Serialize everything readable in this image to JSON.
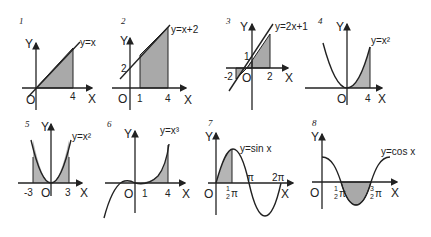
{
  "colors": {
    "shade": "#a9a9a9",
    "line": "#222222",
    "background": "#ffffff"
  },
  "panels": [
    {
      "number": "1",
      "equation": "y=x",
      "x_label": "X",
      "y_label": "Y",
      "origin": "O",
      "ticks": [
        "4"
      ],
      "shaded_interval": "0 to 4"
    },
    {
      "number": "2",
      "equation": "y=x+2",
      "x_label": "X",
      "y_label": "Y",
      "origin": "O",
      "ticks": [
        "1",
        "4"
      ],
      "y_ticks": [
        "2"
      ],
      "shaded_interval": "1 to 4"
    },
    {
      "number": "3",
      "equation": "y=2x+1",
      "x_label": "X",
      "y_label": "Y",
      "origin": "O",
      "ticks": [
        "-2",
        "2"
      ],
      "y_ticks": [
        "1"
      ],
      "shaded_interval": "-2 to 2"
    },
    {
      "number": "4",
      "equation": "y=x²",
      "x_label": "X",
      "y_label": "Y",
      "origin": "O",
      "ticks": [
        "4"
      ],
      "shaded_interval": "0 to 4"
    },
    {
      "number": "5",
      "equation": "y=x²",
      "x_label": "X",
      "y_label": "Y",
      "origin": "O",
      "ticks": [
        "-3",
        "3"
      ],
      "shaded_interval": "-3 to 3"
    },
    {
      "number": "6",
      "equation": "y=x³",
      "x_label": "X",
      "y_label": "Y",
      "origin": "O",
      "ticks": [
        "1",
        "4"
      ],
      "shaded_interval": "1 to 4"
    },
    {
      "number": "7",
      "equation": "y=sin x",
      "x_label": "X",
      "y_label": "Y",
      "origin": "O",
      "ticks": [
        "½π",
        "π",
        "2π"
      ],
      "tick_half_num": "1",
      "tick_half_den": "2",
      "tick_pi": "π",
      "shaded_interval": "0 to π/2"
    },
    {
      "number": "8",
      "equation": "y=cos x",
      "x_label": "X",
      "y_label": "Y",
      "origin": "O",
      "ticks": [
        "½π",
        "³⁄₂π"
      ],
      "tick_half_num": "1",
      "tick_half_den": "2",
      "tick_three_num": "3",
      "tick_pi": "π",
      "shaded_interval": "π/2 to 3π/2"
    }
  ]
}
